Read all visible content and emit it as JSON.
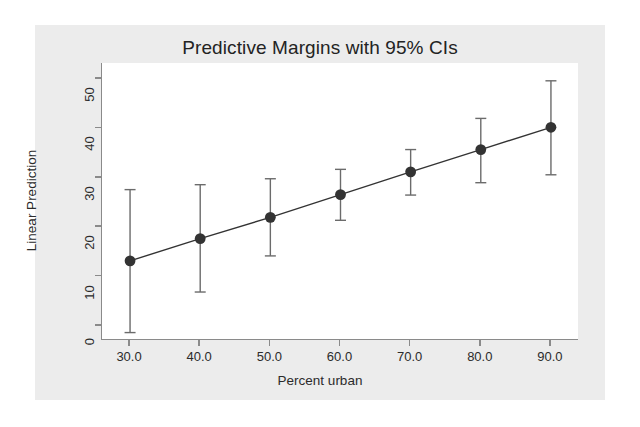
{
  "chart_data": {
    "type": "line",
    "title": "Predictive Margins with 95% CIs",
    "xlabel": "Percent urban",
    "ylabel": "Linear Prediction",
    "xlim": [
      26.0,
      94.0
    ],
    "ylim": [
      -3.0,
      53.0
    ],
    "grid": false,
    "legend": "none",
    "x": [
      30.0,
      40.0,
      50.0,
      60.0,
      70.0,
      80.0,
      90.0
    ],
    "values": [
      13.0,
      17.5,
      21.8,
      26.4,
      31.0,
      35.5,
      40.0
    ],
    "ci_low": [
      -1.5,
      6.7,
      14.0,
      21.2,
      26.3,
      28.8,
      30.4
    ],
    "ci_high": [
      27.4,
      28.4,
      29.6,
      31.5,
      35.5,
      41.8,
      49.4
    ],
    "xticks": [
      30.0,
      40.0,
      50.0,
      60.0,
      70.0,
      80.0,
      90.0
    ],
    "xtick_labels": [
      "30.0",
      "40.0",
      "50.0",
      "60.0",
      "70.0",
      "80.0",
      "90.0"
    ],
    "yticks": [
      0,
      10,
      20,
      30,
      40,
      50
    ],
    "ytick_labels": [
      "0",
      "10",
      "20",
      "30",
      "40",
      "50"
    ],
    "marker": "filled-circle",
    "series_color": "#333333",
    "errorbar_color": "#6b6b6b",
    "panel_background": "#ffffff",
    "figure_background": "#ececec",
    "page_background": "#ffffff"
  }
}
